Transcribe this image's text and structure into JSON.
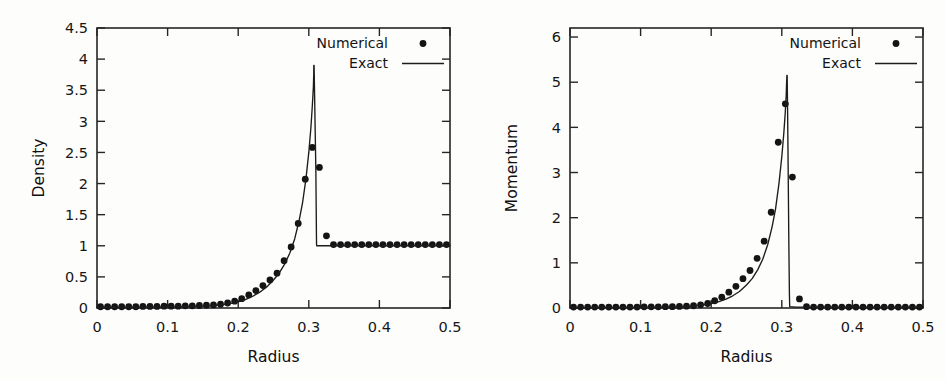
{
  "figure": {
    "background": "#fdfdfc",
    "ink_color": "#1a1a1a"
  },
  "chart_data": [
    {
      "id": "density",
      "type": "scatter",
      "title": "",
      "xlabel": "Radius",
      "ylabel": "Density",
      "xlim": [
        0,
        0.5
      ],
      "ylim": [
        0,
        4.5
      ],
      "xticks": [
        0,
        0.1,
        0.2,
        0.3,
        0.4,
        0.5
      ],
      "xtick_labels": [
        "0",
        "0.1",
        "0.2",
        "0.3",
        "0.4",
        "0.5"
      ],
      "yticks": [
        0,
        0.5,
        1,
        1.5,
        2,
        2.5,
        3,
        3.5,
        4,
        4.5
      ],
      "ytick_labels": [
        "0",
        "0.5",
        "1",
        "1.5",
        "2",
        "2.5",
        "3",
        "3.5",
        "4",
        "4.5"
      ],
      "grid": false,
      "legend_position": "top-right",
      "series": [
        {
          "name": "Numerical",
          "marker": "filled-circle",
          "style": "points",
          "color": "#141414",
          "x": [
            0.005,
            0.015,
            0.025,
            0.035,
            0.045,
            0.055,
            0.065,
            0.075,
            0.085,
            0.095,
            0.105,
            0.115,
            0.125,
            0.135,
            0.145,
            0.155,
            0.165,
            0.175,
            0.185,
            0.195,
            0.205,
            0.215,
            0.225,
            0.235,
            0.245,
            0.255,
            0.265,
            0.275,
            0.285,
            0.295,
            0.305,
            0.315,
            0.325,
            0.335,
            0.345,
            0.355,
            0.365,
            0.375,
            0.385,
            0.395,
            0.405,
            0.415,
            0.425,
            0.435,
            0.445,
            0.455,
            0.465,
            0.475,
            0.485,
            0.495
          ],
          "y": [
            0.02,
            0.02,
            0.02,
            0.02,
            0.02,
            0.02,
            0.025,
            0.025,
            0.025,
            0.03,
            0.03,
            0.03,
            0.035,
            0.035,
            0.04,
            0.045,
            0.05,
            0.06,
            0.08,
            0.11,
            0.15,
            0.21,
            0.28,
            0.36,
            0.45,
            0.56,
            0.76,
            0.98,
            1.36,
            2.07,
            2.58,
            2.26,
            1.16,
            1.02,
            1.02,
            1.02,
            1.02,
            1.02,
            1.02,
            1.02,
            1.02,
            1.02,
            1.02,
            1.02,
            1.02,
            1.02,
            1.02,
            1.02,
            1.02,
            1.02
          ]
        },
        {
          "name": "Exact",
          "marker": "none",
          "style": "line",
          "color": "#1c1c1c",
          "x": [
            0.0,
            0.02,
            0.04,
            0.06,
            0.08,
            0.1,
            0.12,
            0.14,
            0.16,
            0.175,
            0.19,
            0.2,
            0.21,
            0.22,
            0.23,
            0.24,
            0.25,
            0.258,
            0.266,
            0.273,
            0.28,
            0.286,
            0.291,
            0.296,
            0.3,
            0.303,
            0.305,
            0.3065,
            0.307,
            0.3071,
            0.3075,
            0.308,
            0.31,
            0.3105,
            0.3108,
            0.311,
            0.3112,
            0.32,
            0.34,
            0.38,
            0.42,
            0.46,
            0.5
          ],
          "y": [
            0.012,
            0.012,
            0.013,
            0.014,
            0.016,
            0.018,
            0.021,
            0.026,
            0.035,
            0.048,
            0.075,
            0.1,
            0.135,
            0.185,
            0.25,
            0.335,
            0.45,
            0.56,
            0.71,
            0.88,
            1.11,
            1.39,
            1.68,
            2.08,
            2.5,
            2.9,
            3.25,
            3.56,
            3.76,
            3.9,
            3.9,
            3.56,
            2.2,
            1.6,
            1.2,
            1.02,
            1.0,
            1.0,
            1.0,
            1.0,
            1.0,
            1.0,
            1.0
          ]
        }
      ]
    },
    {
      "id": "momentum",
      "type": "scatter",
      "title": "",
      "xlabel": "Radius",
      "ylabel": "Momentum",
      "xlim": [
        0,
        0.5
      ],
      "ylim": [
        0,
        6.2
      ],
      "xticks": [
        0,
        0.1,
        0.2,
        0.3,
        0.4,
        0.5
      ],
      "xtick_labels": [
        "0",
        "0.1",
        "0.2",
        "0.3",
        "0.4",
        "0.5"
      ],
      "yticks": [
        0,
        1,
        2,
        3,
        4,
        5,
        6
      ],
      "ytick_labels": [
        "0",
        "1",
        "2",
        "3",
        "4",
        "5",
        "6"
      ],
      "grid": false,
      "legend_position": "top-right",
      "series": [
        {
          "name": "Numerical",
          "marker": "filled-circle",
          "style": "points",
          "color": "#141414",
          "x": [
            0.005,
            0.015,
            0.025,
            0.035,
            0.045,
            0.055,
            0.065,
            0.075,
            0.085,
            0.095,
            0.105,
            0.115,
            0.125,
            0.135,
            0.145,
            0.155,
            0.165,
            0.175,
            0.185,
            0.195,
            0.205,
            0.215,
            0.225,
            0.235,
            0.245,
            0.255,
            0.265,
            0.275,
            0.285,
            0.295,
            0.305,
            0.315,
            0.325,
            0.335,
            0.345,
            0.355,
            0.365,
            0.375,
            0.385,
            0.395,
            0.405,
            0.415,
            0.425,
            0.435,
            0.445,
            0.455,
            0.465,
            0.475,
            0.485,
            0.495
          ],
          "y": [
            0.02,
            0.02,
            0.02,
            0.02,
            0.02,
            0.02,
            0.02,
            0.02,
            0.02,
            0.02,
            0.025,
            0.025,
            0.025,
            0.03,
            0.03,
            0.035,
            0.04,
            0.05,
            0.07,
            0.1,
            0.16,
            0.24,
            0.35,
            0.48,
            0.65,
            0.83,
            1.1,
            1.48,
            2.12,
            3.67,
            4.52,
            2.9,
            0.2,
            0.03,
            0.02,
            0.02,
            0.02,
            0.02,
            0.02,
            0.02,
            0.02,
            0.02,
            0.02,
            0.02,
            0.02,
            0.02,
            0.02,
            0.02,
            0.02,
            0.02
          ]
        },
        {
          "name": "Exact",
          "marker": "none",
          "style": "line",
          "color": "#1c1c1c",
          "x": [
            0.0,
            0.02,
            0.04,
            0.06,
            0.08,
            0.1,
            0.12,
            0.14,
            0.16,
            0.175,
            0.19,
            0.2,
            0.21,
            0.22,
            0.23,
            0.24,
            0.25,
            0.258,
            0.266,
            0.273,
            0.28,
            0.286,
            0.291,
            0.296,
            0.3,
            0.303,
            0.305,
            0.3062,
            0.3068,
            0.3072,
            0.3076,
            0.3082,
            0.309,
            0.31,
            0.3108,
            0.3112,
            0.32,
            0.34,
            0.38,
            0.42,
            0.46,
            0.5
          ],
          "y": [
            0.01,
            0.01,
            0.011,
            0.012,
            0.013,
            0.015,
            0.018,
            0.023,
            0.032,
            0.045,
            0.072,
            0.098,
            0.135,
            0.19,
            0.265,
            0.365,
            0.51,
            0.65,
            0.85,
            1.08,
            1.4,
            1.78,
            2.18,
            2.76,
            3.35,
            3.9,
            4.35,
            4.7,
            4.98,
            5.15,
            5.15,
            4.4,
            3.1,
            1.4,
            0.3,
            0.03,
            0.02,
            0.02,
            0.02,
            0.02,
            0.02,
            0.02
          ]
        }
      ]
    }
  ]
}
